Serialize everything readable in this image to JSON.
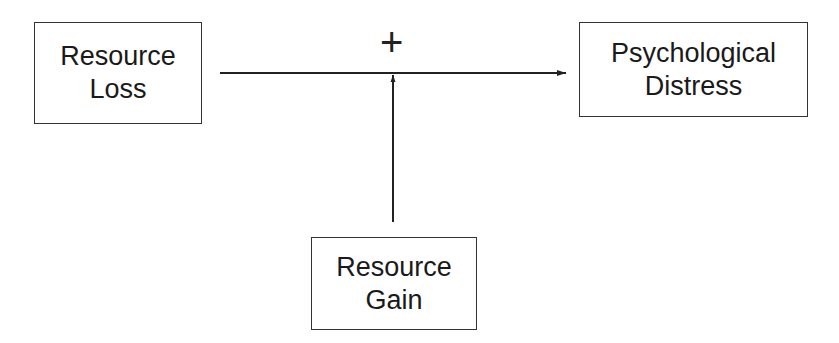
{
  "diagram": {
    "nodes": [
      {
        "id": "resource-loss",
        "lines": [
          "Resource",
          "Loss"
        ]
      },
      {
        "id": "psychological-distress",
        "lines": [
          "Psychological",
          "Distress"
        ]
      },
      {
        "id": "resource-gain",
        "lines": [
          "Resource",
          "Gain"
        ]
      }
    ],
    "edges": [
      {
        "from": "resource-loss",
        "to": "psychological-distress",
        "type": "arrow"
      },
      {
        "from": "resource-gain",
        "to": "resource-loss->psychological-distress",
        "type": "moderation-arrow"
      }
    ],
    "annotation": "+"
  }
}
